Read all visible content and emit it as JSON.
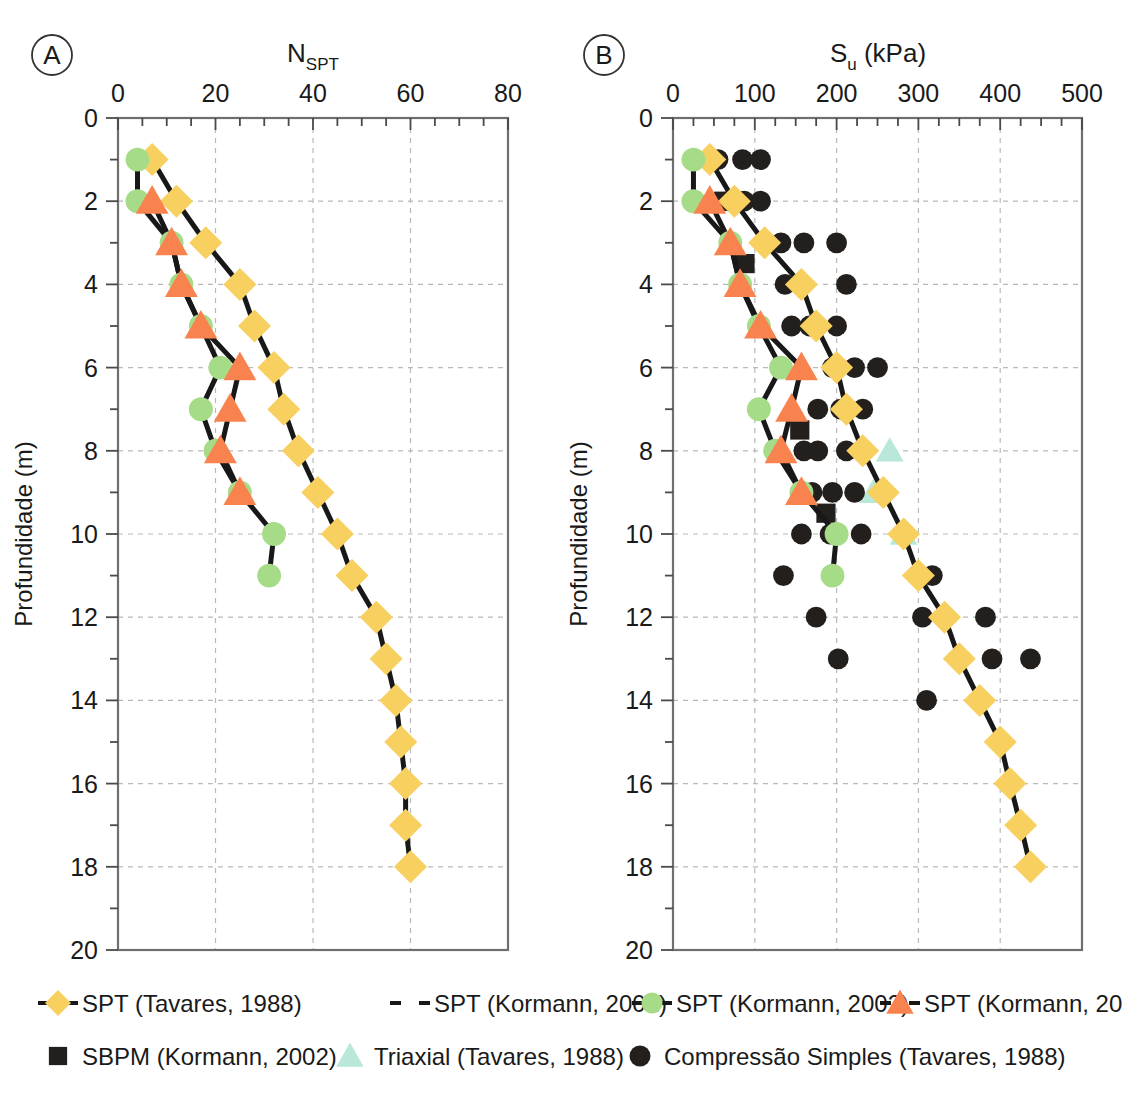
{
  "figure": {
    "panels": [
      {
        "tag": "A",
        "axis_title": "N",
        "axis_title_sub": "SPT",
        "axis_title_full": "N_SPT",
        "xlabel": "N_SPT",
        "ylabel": "Profundidade (m)",
        "xlim": [
          0,
          80
        ],
        "ylim": [
          0,
          20
        ],
        "xticks": [
          0,
          20,
          40,
          60,
          80
        ],
        "xticklabels": [
          "0",
          "20",
          "40",
          "60",
          "80"
        ],
        "yticks": [
          0,
          2,
          4,
          6,
          8,
          10,
          12,
          14,
          16,
          18,
          20
        ],
        "yticklabels": [
          "0",
          "2",
          "4",
          "6",
          "8",
          "10",
          "12",
          "14",
          "16",
          "18",
          "20"
        ],
        "xminor_step": 5,
        "yminor_step": 1,
        "grid": true
      },
      {
        "tag": "B",
        "axis_title": "S",
        "axis_title_sub": "u",
        "axis_title_unit": " (kPa)",
        "axis_title_full": "S_u (kPa)",
        "xlabel": "S_u (kPa)",
        "ylabel": "Profundidade (m)",
        "xlim": [
          0,
          500
        ],
        "ylim": [
          0,
          20
        ],
        "xticks": [
          0,
          100,
          200,
          300,
          400,
          500
        ],
        "xticklabels": [
          "0",
          "100",
          "200",
          "300",
          "400",
          "500"
        ],
        "yticks": [
          0,
          2,
          4,
          6,
          8,
          10,
          12,
          14,
          16,
          18,
          20
        ],
        "yticklabels": [
          "0",
          "2",
          "4",
          "6",
          "8",
          "10",
          "12",
          "14",
          "16",
          "18",
          "20"
        ],
        "xminor_step": 25,
        "yminor_step": 1,
        "grid": true
      }
    ]
  },
  "colors": {
    "spt_tavares_yellow": "#f7d060",
    "spt_kormann_green": "#a6dc88",
    "spt_kormann_orange": "#f9834f",
    "sbpm_black": "#231f1c",
    "triaxial_cyan": "#b9e8db",
    "compressao_black": "#231f1c",
    "line_black": "#181818",
    "frame": "#6f6f6f",
    "grid": "#b9b9b9"
  },
  "legend": {
    "rows": [
      [
        {
          "label": "SPT (Tavares, 1988)",
          "marker": "diamond",
          "color": "#f7d060",
          "line": true,
          "icon": "diamond-marker-icon"
        },
        {
          "label": "SPT (Kormann, 2002)",
          "marker": "none",
          "color": "#231f1c",
          "line": true,
          "dashed": true,
          "icon": "dashed-line-icon"
        },
        {
          "label": "SPT (Kormann, 2002)",
          "marker": "circle",
          "color": "#a6dc88",
          "line": true,
          "icon": "circle-marker-icon"
        },
        {
          "label": "SPT (Kormann, 2002)",
          "marker": "triangle",
          "color": "#f9834f",
          "line": true,
          "icon": "triangle-marker-icon"
        }
      ],
      [
        {
          "label": "SBPM (Kormann, 2002)",
          "marker": "square",
          "color": "#231f1c",
          "line": false,
          "icon": "square-marker-icon"
        },
        {
          "label": "Triaxial (Tavares, 1988)",
          "marker": "triangle",
          "color": "#b9e8db",
          "line": false,
          "icon": "triangle-marker-icon"
        },
        {
          "label": "Compressão Simples (Tavares, 1988)",
          "marker": "circle",
          "color": "#231f1c",
          "line": false,
          "icon": "circle-marker-icon"
        }
      ]
    ]
  },
  "chart_data": [
    {
      "type": "line",
      "panel": "A",
      "title": "N_SPT",
      "xlabel": "N_SPT",
      "ylabel": "Profundidade (m)",
      "xlim": [
        0,
        80
      ],
      "ylim": [
        0,
        20
      ],
      "y_inverted": true,
      "grid": true,
      "legend_position": "below",
      "series": [
        {
          "name": "SPT (Tavares, 1988)",
          "marker": "diamond",
          "color": "#f7d060",
          "x": [
            7,
            12,
            18,
            25,
            28,
            32,
            34,
            37,
            41,
            45,
            48,
            53,
            55,
            57,
            58,
            59,
            59,
            60
          ],
          "y": [
            1,
            2,
            3,
            4,
            5,
            6,
            7,
            8,
            9,
            10,
            11,
            12,
            13,
            14,
            15,
            16,
            17,
            18
          ]
        },
        {
          "name": "SPT (Kormann, 2002) - green circles",
          "marker": "circle",
          "color": "#a6dc88",
          "x": [
            4,
            4,
            11,
            13,
            17,
            21,
            17,
            20,
            25,
            32,
            31
          ],
          "y": [
            1,
            2,
            3,
            4,
            5,
            6,
            7,
            8,
            9,
            10,
            11
          ]
        },
        {
          "name": "SPT (Kormann, 2002) - orange triangles",
          "marker": "triangle",
          "color": "#f9834f",
          "x": [
            7,
            11,
            13,
            17,
            25,
            23,
            21,
            25
          ],
          "y": [
            2,
            3,
            4,
            5,
            6,
            7,
            8,
            9
          ]
        }
      ]
    },
    {
      "type": "scatter",
      "panel": "B",
      "title": "S_u (kPa)",
      "xlabel": "S_u (kPa)",
      "ylabel": "Profundidade (m)",
      "xlim": [
        0,
        500
      ],
      "ylim": [
        0,
        20
      ],
      "y_inverted": true,
      "grid": true,
      "legend_position": "below",
      "series": [
        {
          "name": "SPT (Tavares, 1988)",
          "marker": "diamond",
          "color": "#f7d060",
          "line": true,
          "x": [
            45,
            75,
            112,
            157,
            175,
            200,
            212,
            232,
            257,
            282,
            300,
            332,
            350,
            375,
            400,
            412,
            425,
            437
          ],
          "y": [
            1,
            2,
            3,
            4,
            5,
            6,
            7,
            8,
            9,
            10,
            11,
            12,
            13,
            14,
            15,
            16,
            17,
            18
          ]
        },
        {
          "name": "SPT (Kormann, 2002) - green circles",
          "marker": "circle",
          "color": "#a6dc88",
          "line": true,
          "x": [
            25,
            25,
            70,
            82,
            105,
            132,
            105,
            125,
            157,
            200,
            195
          ],
          "y": [
            1,
            2,
            3,
            4,
            5,
            6,
            7,
            8,
            9,
            10,
            11
          ]
        },
        {
          "name": "SPT (Kormann, 2002) - orange triangles",
          "marker": "triangle",
          "color": "#f9834f",
          "line": true,
          "x": [
            45,
            70,
            82,
            107,
            157,
            145,
            132,
            157
          ],
          "y": [
            2,
            3,
            4,
            5,
            6,
            7,
            8,
            9
          ]
        },
        {
          "name": "SBPM (Kormann, 2002)",
          "marker": "square",
          "color": "#231f1c",
          "line": false,
          "x": [
            62,
            75,
            88,
            155,
            187
          ],
          "y": [
            2,
            2,
            3.5,
            7.5,
            9.5
          ]
        },
        {
          "name": "Triaxial (Tavares, 1988)",
          "marker": "triangle",
          "color": "#b9e8db",
          "line": false,
          "x": [
            265,
            245,
            282
          ],
          "y": [
            8,
            9,
            10
          ]
        },
        {
          "name": "Compressão Simples (Tavares, 1988)",
          "marker": "circle",
          "color": "#231f1c",
          "line": false,
          "x": [
            55,
            85,
            107,
            70,
            75,
            87,
            107,
            132,
            160,
            200,
            137,
            155,
            212,
            145,
            167,
            200,
            132,
            195,
            222,
            250,
            177,
            205,
            232,
            160,
            177,
            212,
            170,
            195,
            222,
            157,
            192,
            230,
            135,
            195,
            317,
            175,
            305,
            382,
            202,
            390,
            437,
            310
          ],
          "y": [
            1,
            1,
            1,
            2,
            2,
            2,
            2,
            3,
            3,
            3,
            4,
            4,
            4,
            5,
            5,
            5,
            6,
            6,
            6,
            6,
            7,
            7,
            7,
            8,
            8,
            8,
            9,
            9,
            9,
            10,
            10,
            10,
            11,
            11,
            11,
            12,
            12,
            12,
            13,
            13,
            13,
            14
          ]
        }
      ]
    }
  ]
}
